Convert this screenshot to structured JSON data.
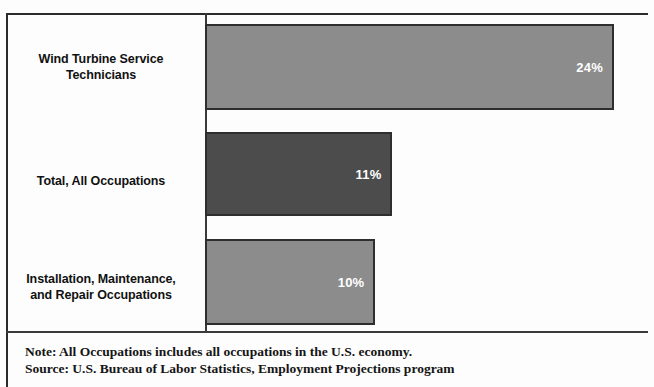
{
  "chart_data": {
    "type": "bar",
    "orientation": "horizontal",
    "title": "",
    "subtitle": "",
    "xlabel": "",
    "ylabel": "",
    "xlim": [
      0,
      26
    ],
    "grid": false,
    "legend": false,
    "categories": [
      "Wind Turbine Service Technicians",
      "Total, All Occupations",
      "Installation, Maintenance, and Repair Occupations"
    ],
    "values": [
      24,
      11,
      10
    ],
    "value_labels": [
      "24%",
      "11%",
      "10%"
    ],
    "bar_colors": [
      "#8c8c8c",
      "#4c4c4c",
      "#8c8c8c"
    ],
    "bars": [
      {
        "category_line1": "Wind Turbine Service",
        "category_line2": "Technicians",
        "value": 24,
        "label": "24%",
        "color": "#8c8c8c"
      },
      {
        "category_line1": "Total, All Occupations",
        "category_line2": "",
        "value": 11,
        "label": "11%",
        "color": "#4c4c4c"
      },
      {
        "category_line1": "Installation, Maintenance,",
        "category_line2": "and Repair Occupations",
        "value": 10,
        "label": "10%",
        "color": "#8c8c8c"
      }
    ]
  },
  "footnotes": {
    "note": "Note: All Occupations includes all occupations in the U.S. economy.",
    "source": "Source: U.S. Bureau of Labor Statistics, Employment Projections program"
  }
}
